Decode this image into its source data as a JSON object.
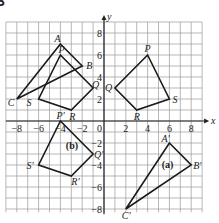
{
  "exercise_number": "3",
  "axes": {
    "x_label": "x",
    "y_label": "y",
    "x_range": [
      -9,
      9
    ],
    "y_range": [
      -8,
      9
    ],
    "x_ticks": [
      {
        "value": -8,
        "label": "−8"
      },
      {
        "value": -6,
        "label": "−6"
      },
      {
        "value": -4,
        "label": "−4"
      },
      {
        "value": -2,
        "label": "−2"
      },
      {
        "value": 2,
        "label": "2"
      },
      {
        "value": 4,
        "label": "4"
      },
      {
        "value": 6,
        "label": "6"
      },
      {
        "value": 8,
        "label": "8"
      }
    ],
    "y_ticks": [
      {
        "value": 8,
        "label": "8"
      },
      {
        "value": 6,
        "label": "6"
      },
      {
        "value": 4,
        "label": "4"
      },
      {
        "value": 2,
        "label": "2"
      },
      {
        "value": -2,
        "label": "−2"
      },
      {
        "value": -4,
        "label": "−4"
      },
      {
        "value": -6,
        "label": "−6"
      },
      {
        "value": -8,
        "label": "−8"
      }
    ],
    "origin_label": "0"
  },
  "shapes": {
    "triangle_ABC": {
      "vertices": [
        {
          "name": "A",
          "x": -4,
          "y": 7
        },
        {
          "name": "B",
          "x": -2,
          "y": 5
        },
        {
          "name": "C",
          "x": -8,
          "y": 2
        }
      ]
    },
    "quad_PQRS_left": {
      "vertices": [
        {
          "name": "P",
          "x": -4,
          "y": 6
        },
        {
          "name": "Q",
          "x": -1,
          "y": 3
        },
        {
          "name": "R",
          "x": -3,
          "y": 1
        },
        {
          "name": "S",
          "x": -6,
          "y": 2
        }
      ]
    },
    "quad_PQRS_right": {
      "vertices": [
        {
          "name": "P",
          "x": 4,
          "y": 6
        },
        {
          "name": "Q",
          "x": 1,
          "y": 3
        },
        {
          "name": "R",
          "x": 3,
          "y": 1
        },
        {
          "name": "S",
          "x": 6,
          "y": 2
        }
      ]
    },
    "quad_b": {
      "label": "(b)",
      "vertices": [
        {
          "name": "P'",
          "x": -4,
          "y": 0
        },
        {
          "name": "Q'",
          "x": -1,
          "y": -3
        },
        {
          "name": "R'",
          "x": -3,
          "y": -5
        },
        {
          "name": "S'",
          "x": -6,
          "y": -4
        }
      ]
    },
    "triangle_a": {
      "label": "(a)",
      "vertices": [
        {
          "name": "A'",
          "x": 6,
          "y": -2
        },
        {
          "name": "B'",
          "x": 8,
          "y": -4
        },
        {
          "name": "C'",
          "x": 2,
          "y": -8
        }
      ]
    }
  },
  "colors": {
    "grid": "#9a9a9a",
    "axis": "#222222",
    "shape_stroke": "#1a1a1a",
    "background": "#ffffff"
  }
}
